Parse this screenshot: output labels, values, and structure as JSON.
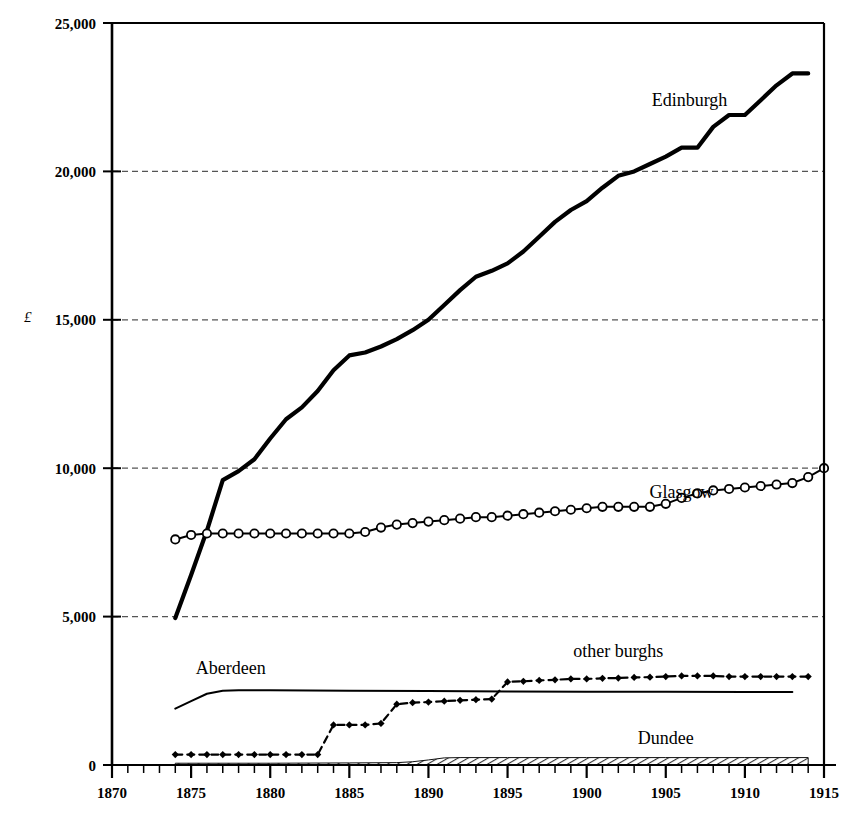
{
  "chart_data": {
    "type": "line",
    "title": "",
    "xlabel": "",
    "ylabel": "£",
    "xlim": [
      1870,
      1915
    ],
    "ylim": [
      0,
      25000
    ],
    "xticks": [
      1870,
      1875,
      1880,
      1885,
      1890,
      1895,
      1900,
      1905,
      1910,
      1915
    ],
    "xtick_labels": [
      "1870",
      "1875",
      "1880",
      "1885",
      "1890",
      "1895",
      "1900",
      "1905",
      "1910",
      "1915"
    ],
    "yticks": [
      0,
      5000,
      10000,
      15000,
      20000,
      25000
    ],
    "ytick_labels": [
      "0",
      "5,000",
      "10,000",
      "15,000",
      "20,000",
      "25,000"
    ],
    "minor_xtick_interval": 1,
    "grid": "horizontal-dashed",
    "legend_position": "inline-annotations",
    "series": [
      {
        "name": "Edinburgh",
        "style": "thick-solid",
        "marker": "none",
        "label_x": 1906.5,
        "label_y": 22200,
        "x": [
          1874,
          1875,
          1876,
          1877,
          1878,
          1879,
          1880,
          1881,
          1882,
          1883,
          1884,
          1885,
          1886,
          1887,
          1888,
          1889,
          1890,
          1891,
          1892,
          1893,
          1894,
          1895,
          1896,
          1897,
          1898,
          1899,
          1900,
          1901,
          1902,
          1903,
          1904,
          1905,
          1906,
          1907,
          1908,
          1909,
          1910,
          1911,
          1912,
          1913,
          1914
        ],
        "y": [
          4950,
          6400,
          7900,
          9600,
          9900,
          10300,
          11000,
          11650,
          12050,
          12600,
          13300,
          13800,
          13900,
          14100,
          14350,
          14650,
          15000,
          15500,
          16000,
          16450,
          16650,
          16900,
          17300,
          17800,
          18300,
          18700,
          19000,
          19450,
          19850,
          20000,
          20250,
          20500,
          20800,
          20800,
          21500,
          21900,
          21900,
          22400,
          22900,
          23300,
          23300
        ]
      },
      {
        "name": "Glasgow",
        "style": "thin-solid",
        "marker": "open-circle",
        "label_x": 1906.0,
        "label_y": 9000,
        "x": [
          1874,
          1875,
          1876,
          1877,
          1878,
          1879,
          1880,
          1881,
          1882,
          1883,
          1884,
          1885,
          1886,
          1887,
          1888,
          1889,
          1890,
          1891,
          1892,
          1893,
          1894,
          1895,
          1896,
          1897,
          1898,
          1899,
          1900,
          1901,
          1902,
          1903,
          1904,
          1905,
          1906,
          1907,
          1908,
          1909,
          1910,
          1911,
          1912,
          1913,
          1914,
          1915
        ],
        "y": [
          7600,
          7750,
          7800,
          7800,
          7800,
          7800,
          7800,
          7800,
          7800,
          7800,
          7800,
          7800,
          7850,
          8000,
          8100,
          8150,
          8200,
          8250,
          8300,
          8350,
          8350,
          8400,
          8450,
          8500,
          8550,
          8600,
          8650,
          8700,
          8700,
          8700,
          8700,
          8800,
          9000,
          9150,
          9250,
          9300,
          9350,
          9400,
          9450,
          9500,
          9700,
          10000
        ]
      },
      {
        "name": "Aberdeen",
        "style": "thin-solid",
        "marker": "none",
        "label_x": 1877.5,
        "label_y": 3050,
        "x": [
          1874,
          1875,
          1876,
          1877,
          1878,
          1880,
          1885,
          1890,
          1895,
          1900,
          1905,
          1910,
          1913
        ],
        "y": [
          1900,
          2150,
          2400,
          2500,
          2520,
          2520,
          2500,
          2490,
          2480,
          2470,
          2470,
          2460,
          2460
        ]
      },
      {
        "name": "other burghs",
        "style": "dashed",
        "marker": "filled-diamond",
        "label_x": 1902.0,
        "label_y": 3650,
        "x": [
          1874,
          1875,
          1876,
          1877,
          1878,
          1879,
          1880,
          1881,
          1882,
          1883,
          1884,
          1885,
          1886,
          1887,
          1888,
          1889,
          1890,
          1891,
          1892,
          1893,
          1894,
          1895,
          1896,
          1897,
          1898,
          1899,
          1900,
          1901,
          1902,
          1903,
          1904,
          1905,
          1906,
          1907,
          1908,
          1909,
          1910,
          1911,
          1912,
          1913,
          1914
        ],
        "y": [
          350,
          350,
          350,
          350,
          350,
          350,
          350,
          350,
          350,
          350,
          1350,
          1350,
          1350,
          1400,
          2050,
          2100,
          2120,
          2150,
          2180,
          2200,
          2220,
          2800,
          2820,
          2850,
          2870,
          2900,
          2900,
          2920,
          2930,
          2950,
          2960,
          2980,
          3000,
          3000,
          3000,
          2980,
          2980,
          2980,
          2980,
          2980,
          2980
        ]
      },
      {
        "name": "Dundee",
        "style": "hatched-band",
        "marker": "none",
        "label_x": 1905.0,
        "label_y": 700,
        "x": [
          1874,
          1880,
          1885,
          1888,
          1889,
          1890,
          1891,
          1892,
          1895,
          1900,
          1905,
          1910,
          1914
        ],
        "y": [
          60,
          60,
          70,
          80,
          110,
          170,
          240,
          250,
          250,
          250,
          250,
          250,
          250
        ]
      }
    ]
  },
  "axis": {
    "y_unit_symbol": "£"
  }
}
